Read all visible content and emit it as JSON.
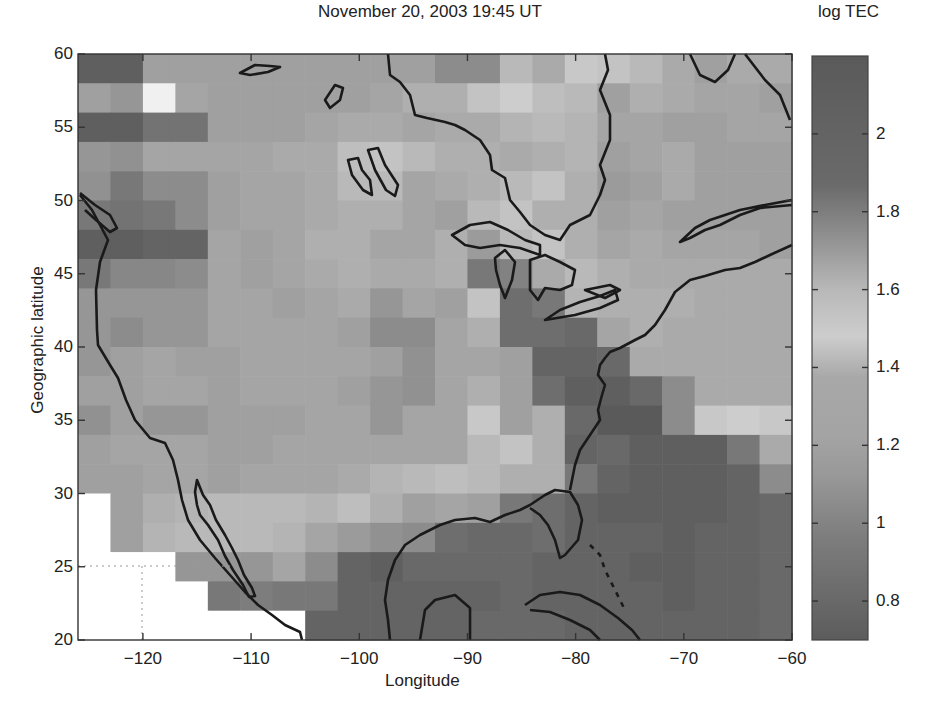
{
  "chart_data": {
    "type": "heatmap",
    "title": "November 20, 2003 19:45 UT",
    "xlabel": "Longitude",
    "ylabel": "Geographic latitude",
    "colorbar_label": "log TEC",
    "xlim": [
      -126,
      -60
    ],
    "ylim": [
      20,
      60
    ],
    "xticks": [
      -120,
      -110,
      -100,
      -90,
      -80,
      -70,
      -60
    ],
    "yticks": [
      20,
      25,
      30,
      35,
      40,
      45,
      50,
      55,
      60
    ],
    "colorbar_ticks": [
      0.8,
      1,
      1.2,
      1.4,
      1.6,
      1.8,
      2
    ],
    "colorbar_range": [
      0.7,
      2.2
    ],
    "grid": {
      "lon_step_deg": 3,
      "lat_step_deg": 2,
      "cols": 22,
      "rows": 20
    },
    "overlay": "coastlines (North America, Great Lakes, Caribbean)",
    "gray_rows_top_to_bottom": [
      [
        95,
        95,
        160,
        160,
        160,
        160,
        160,
        160,
        160,
        160,
        160,
        140,
        140,
        185,
        170,
        200,
        195,
        185,
        170,
        160,
        170,
        170
      ],
      [
        160,
        150,
        240,
        165,
        160,
        160,
        160,
        160,
        160,
        165,
        175,
        175,
        195,
        205,
        190,
        185,
        160,
        175,
        170,
        165,
        165,
        160
      ],
      [
        95,
        95,
        115,
        115,
        160,
        160,
        160,
        165,
        170,
        170,
        165,
        170,
        170,
        180,
        185,
        180,
        165,
        165,
        160,
        160,
        165,
        165
      ],
      [
        150,
        145,
        165,
        165,
        165,
        165,
        170,
        170,
        190,
        195,
        185,
        175,
        175,
        170,
        175,
        180,
        160,
        165,
        170,
        160,
        160,
        160
      ],
      [
        145,
        120,
        140,
        140,
        160,
        165,
        165,
        170,
        185,
        185,
        165,
        170,
        175,
        185,
        195,
        175,
        155,
        160,
        170,
        160,
        160,
        160
      ],
      [
        120,
        115,
        120,
        140,
        160,
        165,
        165,
        170,
        175,
        175,
        165,
        160,
        185,
        195,
        175,
        175,
        160,
        165,
        160,
        160,
        160,
        160
      ],
      [
        95,
        95,
        100,
        100,
        165,
        160,
        165,
        175,
        175,
        165,
        165,
        175,
        155,
        185,
        195,
        175,
        165,
        170,
        165,
        165,
        165,
        160
      ],
      [
        120,
        135,
        135,
        140,
        165,
        160,
        165,
        170,
        175,
        170,
        170,
        175,
        120,
        130,
        170,
        185,
        175,
        170,
        170,
        170,
        170,
        170
      ],
      [
        150,
        150,
        150,
        150,
        165,
        165,
        160,
        165,
        170,
        150,
        165,
        160,
        195,
        110,
        120,
        180,
        175,
        175,
        175,
        170,
        170,
        170
      ],
      [
        150,
        140,
        150,
        150,
        165,
        165,
        165,
        165,
        160,
        140,
        140,
        165,
        175,
        110,
        110,
        105,
        165,
        175,
        170,
        170,
        170,
        170
      ],
      [
        150,
        160,
        165,
        160,
        160,
        165,
        165,
        165,
        165,
        160,
        145,
        165,
        165,
        160,
        100,
        100,
        105,
        170,
        170,
        170,
        170,
        170
      ],
      [
        160,
        160,
        165,
        165,
        160,
        165,
        165,
        165,
        160,
        150,
        145,
        165,
        175,
        160,
        110,
        95,
        95,
        105,
        140,
        170,
        170,
        170
      ],
      [
        145,
        160,
        150,
        150,
        160,
        160,
        160,
        165,
        165,
        150,
        165,
        165,
        200,
        160,
        175,
        105,
        90,
        90,
        140,
        200,
        205,
        200
      ],
      [
        160,
        165,
        165,
        165,
        160,
        160,
        165,
        165,
        165,
        165,
        165,
        165,
        185,
        195,
        175,
        100,
        105,
        95,
        95,
        95,
        120,
        170
      ],
      [
        160,
        160,
        165,
        165,
        160,
        165,
        165,
        165,
        170,
        180,
        185,
        190,
        185,
        175,
        175,
        120,
        100,
        95,
        95,
        95,
        100,
        140
      ],
      [
        255,
        160,
        175,
        180,
        185,
        185,
        185,
        180,
        190,
        175,
        160,
        165,
        160,
        120,
        110,
        100,
        95,
        95,
        95,
        95,
        100,
        105
      ],
      [
        255,
        160,
        180,
        185,
        185,
        185,
        180,
        165,
        155,
        145,
        140,
        110,
        105,
        105,
        110,
        100,
        100,
        100,
        95,
        100,
        100,
        105
      ],
      [
        255,
        255,
        255,
        150,
        150,
        150,
        165,
        140,
        100,
        95,
        105,
        105,
        105,
        105,
        100,
        100,
        100,
        95,
        95,
        100,
        100,
        105
      ],
      [
        255,
        255,
        255,
        255,
        120,
        125,
        120,
        120,
        100,
        100,
        100,
        100,
        100,
        105,
        100,
        100,
        100,
        100,
        95,
        100,
        100,
        105
      ],
      [
        255,
        255,
        255,
        255,
        255,
        255,
        255,
        100,
        100,
        100,
        100,
        100,
        105,
        105,
        105,
        100,
        100,
        100,
        100,
        100,
        100,
        105
      ]
    ]
  }
}
